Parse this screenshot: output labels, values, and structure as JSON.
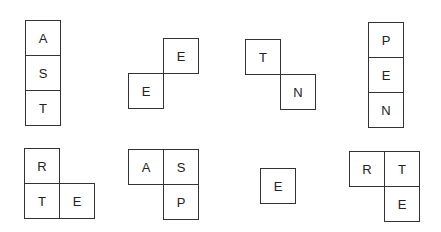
{
  "tile_size": 36,
  "colors": {
    "border": "#333333",
    "text": "#222222",
    "background": "#ffffff"
  },
  "pieces": [
    {
      "id": "piece-ast",
      "x": 25,
      "y": 20,
      "tiles": [
        {
          "letter": "A",
          "col": 0,
          "row": 0
        },
        {
          "letter": "S",
          "col": 0,
          "row": 1
        },
        {
          "letter": "T",
          "col": 0,
          "row": 2
        }
      ]
    },
    {
      "id": "piece-ee",
      "x": 128,
      "y": 38,
      "tiles": [
        {
          "letter": "E",
          "col": 1,
          "row": 0
        },
        {
          "letter": "E",
          "col": 0,
          "row": 1
        }
      ]
    },
    {
      "id": "piece-tn",
      "x": 245,
      "y": 39,
      "tiles": [
        {
          "letter": "T",
          "col": 0,
          "row": 0
        },
        {
          "letter": "N",
          "col": 1,
          "row": 1
        }
      ]
    },
    {
      "id": "piece-pen",
      "x": 368,
      "y": 22,
      "tiles": [
        {
          "letter": "P",
          "col": 0,
          "row": 0
        },
        {
          "letter": "E",
          "col": 0,
          "row": 1
        },
        {
          "letter": "N",
          "col": 0,
          "row": 2
        }
      ]
    },
    {
      "id": "piece-rte-l",
      "x": 24,
      "y": 148,
      "tiles": [
        {
          "letter": "R",
          "col": 0,
          "row": 0
        },
        {
          "letter": "T",
          "col": 0,
          "row": 1
        },
        {
          "letter": "E",
          "col": 1,
          "row": 1
        }
      ]
    },
    {
      "id": "piece-asp",
      "x": 128,
      "y": 149,
      "tiles": [
        {
          "letter": "A",
          "col": 0,
          "row": 0
        },
        {
          "letter": "S",
          "col": 1,
          "row": 0
        },
        {
          "letter": "P",
          "col": 1,
          "row": 1
        }
      ]
    },
    {
      "id": "piece-e",
      "x": 260,
      "y": 168,
      "tiles": [
        {
          "letter": "E",
          "col": 0,
          "row": 0
        }
      ]
    },
    {
      "id": "piece-rte-j",
      "x": 349,
      "y": 151,
      "tiles": [
        {
          "letter": "R",
          "col": 0,
          "row": 0
        },
        {
          "letter": "T",
          "col": 1,
          "row": 0
        },
        {
          "letter": "E",
          "col": 1,
          "row": 1
        }
      ]
    }
  ]
}
